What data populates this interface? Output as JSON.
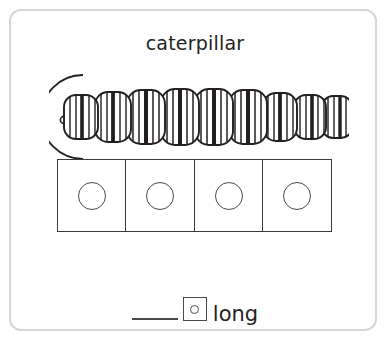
{
  "card": {
    "border_color": "#d6d6d8",
    "background": "#ffffff"
  },
  "title": {
    "text": "caterpillar"
  },
  "figure": {
    "name": "caterpillar",
    "ink_color": "#231f20",
    "segment_count": 9,
    "has_head_arc": true,
    "has_mouth_nub": true,
    "segments": [
      {
        "index": 1,
        "cx": 32,
        "rx": 17,
        "ry": 22,
        "stripes": 7,
        "thick_stripe_index": 3
      },
      {
        "index": 2,
        "cx": 64,
        "rx": 18,
        "ry": 25,
        "stripes": 7,
        "thick_stripe_index": 3
      },
      {
        "index": 3,
        "cx": 97,
        "rx": 19,
        "ry": 27,
        "stripes": 7,
        "thick_stripe_index": 3
      },
      {
        "index": 4,
        "cx": 131,
        "rx": 19,
        "ry": 28,
        "stripes": 7,
        "thick_stripe_index": 3
      },
      {
        "index": 5,
        "cx": 165,
        "rx": 19,
        "ry": 28,
        "stripes": 7,
        "thick_stripe_index": 3
      },
      {
        "index": 6,
        "cx": 199,
        "rx": 19,
        "ry": 27,
        "stripes": 7,
        "thick_stripe_index": 3
      },
      {
        "index": 7,
        "cx": 231,
        "rx": 17,
        "ry": 24,
        "stripes": 7,
        "thick_stripe_index": 3
      },
      {
        "index": 8,
        "cx": 261,
        "rx": 16,
        "ry": 22,
        "stripes": 6,
        "thick_stripe_index": 3
      },
      {
        "index": 9,
        "cx": 288,
        "rx": 15,
        "ry": 21,
        "stripes": 6,
        "thick_stripe_index": 3
      }
    ]
  },
  "counting_boxes": {
    "count": 4,
    "boxes": [
      {
        "index": 1,
        "marker": "circle"
      },
      {
        "index": 2,
        "marker": "circle"
      },
      {
        "index": 3,
        "marker": "circle"
      },
      {
        "index": 4,
        "marker": "circle"
      }
    ]
  },
  "answer": {
    "blank_value": "",
    "blank_placeholder": "",
    "unit_marker": "circle",
    "unit_label": "long"
  }
}
